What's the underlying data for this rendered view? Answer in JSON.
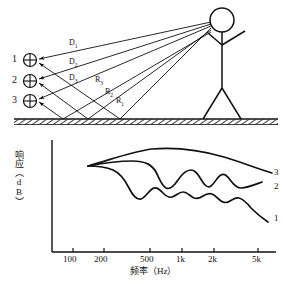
{
  "figure": {
    "title_absent": true,
    "upper_scene": {
      "description": "stick figure talker with direct and ground-reflected sound rays to three receiver positions",
      "sources": [
        {
          "label": "1"
        },
        {
          "label": "2"
        },
        {
          "label": "3"
        }
      ],
      "marker_icon": "circled-plus-icon",
      "talker_icon": "stick-figure-icon",
      "ground_icon": "hatched-ground-icon",
      "ray_labels": {
        "direct": [
          {
            "text": "D",
            "sub": "1"
          },
          {
            "text": "D",
            "sub": "2"
          },
          {
            "text": "D",
            "sub": "3"
          }
        ],
        "reflected": [
          {
            "text": "R",
            "sub": "3"
          },
          {
            "text": "R",
            "sub": "2"
          },
          {
            "text": "R",
            "sub": "1"
          }
        ]
      }
    }
  },
  "chart_data": {
    "type": "line",
    "title": "",
    "xlabel": "频率（Hz）",
    "ylabel": "响应（dB）",
    "xscale": "log",
    "grid": false,
    "legend": "right-inline",
    "xlim": [
      80,
      6000
    ],
    "ylim": [
      0,
      1
    ],
    "ticks": [
      {
        "label": "100",
        "x": 73
      },
      {
        "label": "200",
        "x": 104
      },
      {
        "label": "500",
        "x": 150
      },
      {
        "label": "1k",
        "x": 182
      },
      {
        "label": "2k",
        "x": 214
      },
      {
        "label": "5k",
        "x": 258
      }
    ],
    "series": [
      {
        "name": "3",
        "label": "3",
        "note": "smooth, highest response, shallow arch, no comb ripple",
        "path": "M88,166 C110,160 130,152 152,149 C176,147 200,150 224,157 C244,163 258,169 272,173",
        "label_x": 274,
        "label_y": 168
      },
      {
        "name": "2",
        "label": "2",
        "note": "medium comb ripple, mid-level response",
        "path": "M88,166 C104,163 118,161 132,161 C146,161 152,165 156,172 C160,180 162,186 166,188 C170,190 174,186 178,180 C182,174 186,170 191,170 C196,170 199,176 202,181 C205,186 208,188 211,186 C215,183 217,177 221,175 C225,173 228,177 231,181 C234,185 237,188 241,188 C247,188 254,185 262,182",
        "label_x": 274,
        "label_y": 182
      },
      {
        "name": "1",
        "label": "1",
        "note": "fine dense comb ripple, lowest response, strongest rolloff",
        "path": "M88,166 C98,166 106,167 113,170 C120,173 125,180 129,188 C133,196 137,200 141,199 C145,198 148,192 152,189 C156,186 159,189 163,193 C166,196 169,198 172,197 C176,196 179,192 183,192 C187,192 190,196 194,198 C197,199 200,198 203,196 C206,194 209,193 212,194 C215,195 218,199 221,201 C224,203 227,203 230,201 C233,199 236,197 239,198 C243,199 247,203 251,208 C256,213 262,218 268,222",
        "label_x": 274,
        "label_y": 214
      }
    ]
  }
}
